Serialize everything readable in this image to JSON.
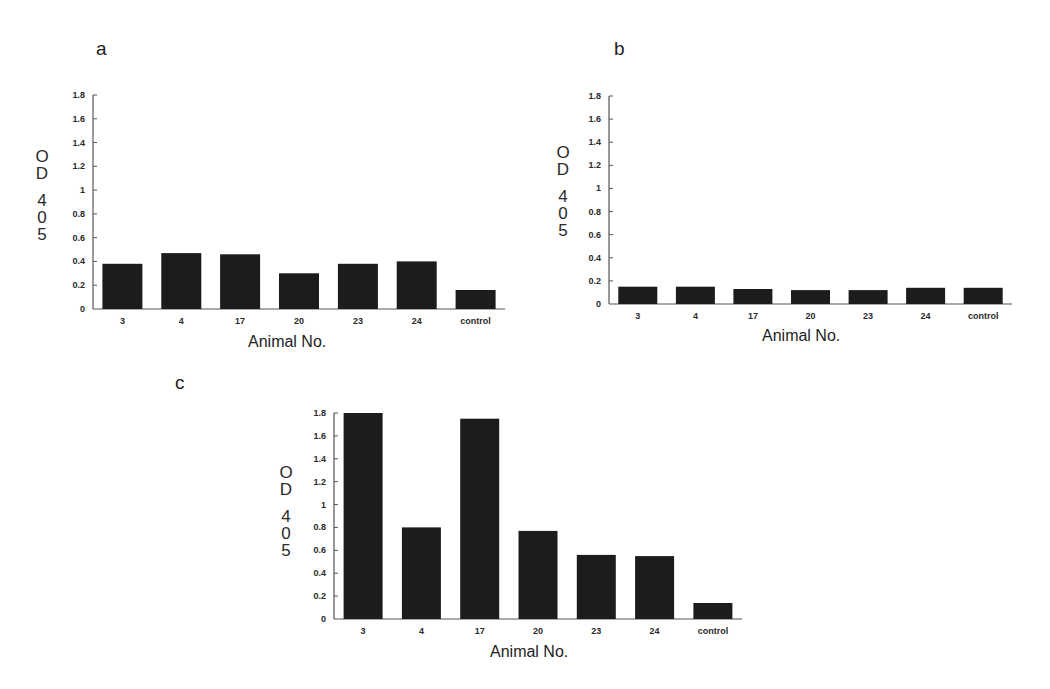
{
  "figure": {
    "panels": [
      {
        "label": "a",
        "ylabel_lines": [
          "O",
          "D",
          "",
          "4",
          "0",
          "5"
        ],
        "xlabel": "Animal No."
      },
      {
        "label": "b",
        "ylabel_lines": [
          "O",
          "D",
          "",
          "4",
          "0",
          "5"
        ],
        "xlabel": "Animal No."
      },
      {
        "label": "c",
        "ylabel_lines": [
          "O",
          "D",
          "",
          "4",
          "0",
          "5"
        ],
        "xlabel": "Animal No."
      }
    ],
    "bar_color": "#1c1c1c",
    "axis_color": "#555555"
  },
  "chart_data": [
    {
      "type": "bar",
      "panel": "a",
      "title": "a",
      "xlabel": "Animal No.",
      "ylabel": "OD 405",
      "categories": [
        "3",
        "4",
        "17",
        "20",
        "23",
        "24",
        "control"
      ],
      "values": [
        0.38,
        0.47,
        0.46,
        0.3,
        0.38,
        0.4,
        0.16
      ],
      "ylim": [
        0,
        1.8
      ],
      "yticks": [
        "0",
        "0.2",
        "0.4",
        "0.6",
        "0.8",
        "1",
        "1.2",
        "1.4",
        "1.6",
        "1.8"
      ],
      "grid": false,
      "legend": null
    },
    {
      "type": "bar",
      "panel": "b",
      "title": "b",
      "xlabel": "Animal No.",
      "ylabel": "OD 405",
      "categories": [
        "3",
        "4",
        "17",
        "20",
        "23",
        "24",
        "control"
      ],
      "values": [
        0.15,
        0.15,
        0.13,
        0.12,
        0.12,
        0.14,
        0.14
      ],
      "ylim": [
        0,
        1.8
      ],
      "yticks": [
        "0",
        "0.2",
        "0.4",
        "0.6",
        "0.8",
        "1",
        "1.2",
        "1.4",
        "1.6",
        "1.8"
      ],
      "grid": false,
      "legend": null
    },
    {
      "type": "bar",
      "panel": "c",
      "title": "c",
      "xlabel": "Animal No.",
      "ylabel": "OD 405",
      "categories": [
        "3",
        "4",
        "17",
        "20",
        "23",
        "24",
        "control"
      ],
      "values": [
        1.8,
        0.8,
        1.75,
        0.77,
        0.56,
        0.55,
        0.14
      ],
      "ylim": [
        0,
        1.8
      ],
      "yticks": [
        "0",
        "0.2",
        "0.4",
        "0.6",
        "0.8",
        "1",
        "1.2",
        "1.4",
        "1.6",
        "1.8"
      ],
      "grid": false,
      "legend": null
    }
  ]
}
